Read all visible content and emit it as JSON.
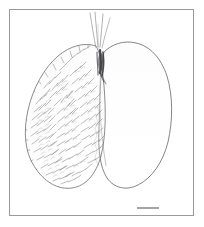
{
  "figure": {
    "domain": "Natural-Image",
    "kind": "scientific-line-illustration",
    "medium": "ink-and-pencil-stipple",
    "background_color": "#ffffff",
    "frame": {
      "name": "plate-border",
      "color": "#9a9a9a",
      "x": 9,
      "y": 9,
      "width": 185,
      "height": 207,
      "stroke_width": 1
    },
    "canvas": {
      "width": 204,
      "height": 227
    }
  },
  "specimen": {
    "forewing": {
      "label": "forewing",
      "position": "left",
      "outline_color": "#6f6f73",
      "texture": "dense-setae-scales",
      "bounds": {
        "x": 24,
        "y": 42,
        "width": 84,
        "height": 148
      }
    },
    "hindwing": {
      "label": "hindwing",
      "position": "right",
      "outline_color": "#7a7a7e",
      "texture": "smooth-unmarked",
      "bounds": {
        "x": 100,
        "y": 40,
        "width": 72,
        "height": 148
      }
    },
    "setae": {
      "label": "basal setae",
      "count": 4,
      "color": "#9a9a9e",
      "position": "wing-base-apex"
    },
    "wing_base": {
      "label": "wing base articulation",
      "color": "#2e2e32",
      "position": "between-wings"
    }
  },
  "scalebar": {
    "name": "scale-bar",
    "color": "#8d8d92",
    "x1": 137,
    "x2": 159,
    "y": 208,
    "thickness": 1.6,
    "caption": ""
  },
  "chart_data": {
    "type": "table",
    "title": "",
    "categories": [
      "forewing",
      "hindwing",
      "setae",
      "scale bar"
    ],
    "values": [
      1,
      1,
      4,
      1
    ],
    "xlabel": "",
    "ylabel": "",
    "legend": []
  }
}
